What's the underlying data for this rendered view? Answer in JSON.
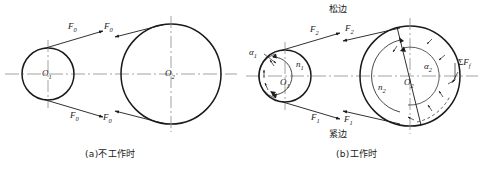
{
  "figure": {
    "title_a": "(a)不工作时",
    "title_b": "(b)工作时",
    "slack_side_label": "松边",
    "tight_side_label": "紧边"
  },
  "diagram_a": {
    "small_pulley_center_label": "O",
    "small_pulley_center_sub": "1",
    "large_pulley_center_label": "O",
    "large_pulley_center_sub": "2",
    "forces": [
      {
        "name": "F",
        "sub": "0",
        "position": "small-pulley-upper"
      },
      {
        "name": "F",
        "sub": "0",
        "position": "small-pulley-lower"
      },
      {
        "name": "F",
        "sub": "0",
        "position": "large-pulley-upper"
      },
      {
        "name": "F",
        "sub": "0",
        "position": "large-pulley-lower"
      }
    ]
  },
  "diagram_b": {
    "small_pulley_center_label": "O",
    "small_pulley_center_sub": "1",
    "large_pulley_center_label": "O",
    "large_pulley_center_sub": "2",
    "wrap_angle_small": "α",
    "wrap_angle_small_sub": "1",
    "wrap_angle_large": "α",
    "wrap_angle_large_sub": "2",
    "speed_small": "n",
    "speed_small_sub": "1",
    "speed_large": "n",
    "speed_large_sub": "2",
    "friction_sum_sigma": "Σ",
    "friction_sum_f": "F",
    "friction_sum_sub": "f",
    "forces": [
      {
        "name": "F",
        "sub": "2",
        "position": "small-pulley-upper-slack"
      },
      {
        "name": "F",
        "sub": "2",
        "position": "large-pulley-upper-slack"
      },
      {
        "name": "F",
        "sub": "1",
        "position": "small-pulley-lower-tight"
      },
      {
        "name": "F",
        "sub": "1",
        "position": "large-pulley-lower-tight"
      }
    ]
  },
  "colors": {
    "stroke": "#1a1a1a",
    "centerline": "#8a8a8a",
    "background": "#ffffff"
  }
}
